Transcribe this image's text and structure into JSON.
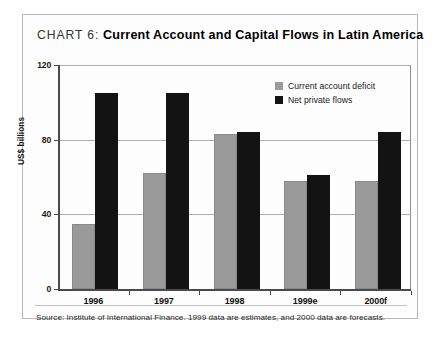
{
  "title": {
    "chart_number": "CHART 6:",
    "main": "Current Account and Capital Flows in Latin America"
  },
  "source": "Source: Institute of International Finance. 1999 data are estimates, and 2000 data are forecasts.",
  "legend": {
    "items": [
      {
        "label": "Current account deficit",
        "color": "#9a9a9a"
      },
      {
        "label": "Net private flows",
        "color": "#131313"
      }
    ]
  },
  "axis": {
    "y_label": "US$ billions",
    "y_ticks": [
      "0",
      "40",
      "80",
      "120"
    ],
    "x_ticks": [
      "1996",
      "1997",
      "1998",
      "1999e",
      "2000f"
    ]
  },
  "chart_data": {
    "type": "bar",
    "title": "CHART 6: Current Account and Capital Flows in Latin America",
    "xlabel": "",
    "ylabel": "US$ billions",
    "ylim": [
      0,
      120
    ],
    "yticks": [
      0,
      40,
      80,
      120
    ],
    "grid": true,
    "legend_position": "top-right",
    "categories": [
      "1996",
      "1997",
      "1998",
      "1999e",
      "2000f"
    ],
    "series": [
      {
        "name": "Current account deficit",
        "color": "#9a9a9a",
        "values": [
          35,
          62,
          83,
          58,
          58
        ]
      },
      {
        "name": "Net private flows",
        "color": "#131313",
        "values": [
          105,
          105,
          84,
          61,
          84
        ]
      }
    ],
    "annotations": [
      "Source: Institute of International Finance. 1999 data are estimates, and 2000 data are forecasts."
    ]
  }
}
